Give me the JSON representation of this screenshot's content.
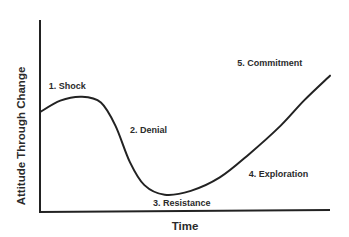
{
  "chart_data": {
    "type": "line",
    "title": "",
    "xlabel": "Time",
    "ylabel": "Attitude Through Change",
    "xlim": [
      0,
      100
    ],
    "ylim": [
      0,
      100
    ],
    "grid": false,
    "ticks": "none",
    "series": [
      {
        "name": "Attitude",
        "color": "#222222",
        "x": [
          0,
          7,
          14.5,
          21,
          26,
          31,
          36,
          43,
          52,
          62,
          72,
          83,
          91,
          100
        ],
        "y": [
          52,
          58,
          60,
          57,
          45,
          26,
          14,
          9,
          11,
          18,
          30,
          45,
          58,
          71
        ]
      }
    ],
    "annotations": [
      {
        "text": "1. Shock",
        "x": 3,
        "y": 64
      },
      {
        "text": "2. Denial",
        "x": 31,
        "y": 41
      },
      {
        "text": "3. Resistance",
        "x": 39,
        "y": 3
      },
      {
        "text": "4. Exploration",
        "x": 72,
        "y": 18
      },
      {
        "text": "5. Commitment",
        "x": 68,
        "y": 76
      }
    ]
  }
}
